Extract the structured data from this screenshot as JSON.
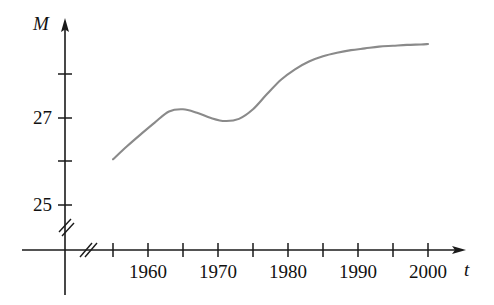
{
  "chart_data": {
    "type": "line",
    "title": "",
    "xlabel": "t",
    "ylabel": "M",
    "axis_label_x": "t",
    "axis_label_y": "M",
    "xlim": [
      1952.5,
      2002
    ],
    "ylim": [
      24.4,
      28.9
    ],
    "grid": false,
    "legend": null,
    "axis_break_x": true,
    "axis_break_y": true,
    "x_tick_values": [
      1955,
      1960,
      1965,
      1970,
      1975,
      1980,
      1985,
      1990,
      1995,
      2000
    ],
    "x_tick_labels": [
      "",
      "1960",
      "",
      "1970",
      "",
      "1980",
      "",
      "1990",
      "",
      "2000"
    ],
    "x_labeled_ticks": [
      "1960",
      "1970",
      "1980",
      "1990",
      "2000"
    ],
    "y_tick_values": [
      25,
      26,
      27,
      28
    ],
    "y_tick_labels": [
      "25",
      "",
      "27",
      ""
    ],
    "y_labeled_ticks": [
      "25",
      "27"
    ],
    "series": [
      {
        "name": "M(t)",
        "color": "#8a8a8a",
        "x": [
          1955,
          1957,
          1959,
          1961,
          1963,
          1965,
          1967,
          1969,
          1971,
          1973,
          1975,
          1977,
          1979,
          1981,
          1983,
          1985,
          1987,
          1989,
          1991,
          1993,
          1995,
          1997,
          1999,
          2000
        ],
        "values": [
          26.05,
          26.35,
          26.63,
          26.9,
          27.15,
          27.2,
          27.12,
          27.0,
          26.93,
          26.98,
          27.2,
          27.55,
          27.88,
          28.12,
          28.3,
          28.42,
          28.5,
          28.56,
          28.6,
          28.64,
          28.66,
          28.68,
          28.69,
          28.7
        ]
      }
    ],
    "annotations": []
  },
  "axes": {
    "y_name": "M",
    "x_name": "t"
  },
  "colors": {
    "axis": "#1a1a1a",
    "curve": "#8a8a8a",
    "background": "#ffffff",
    "text": "#111111"
  }
}
